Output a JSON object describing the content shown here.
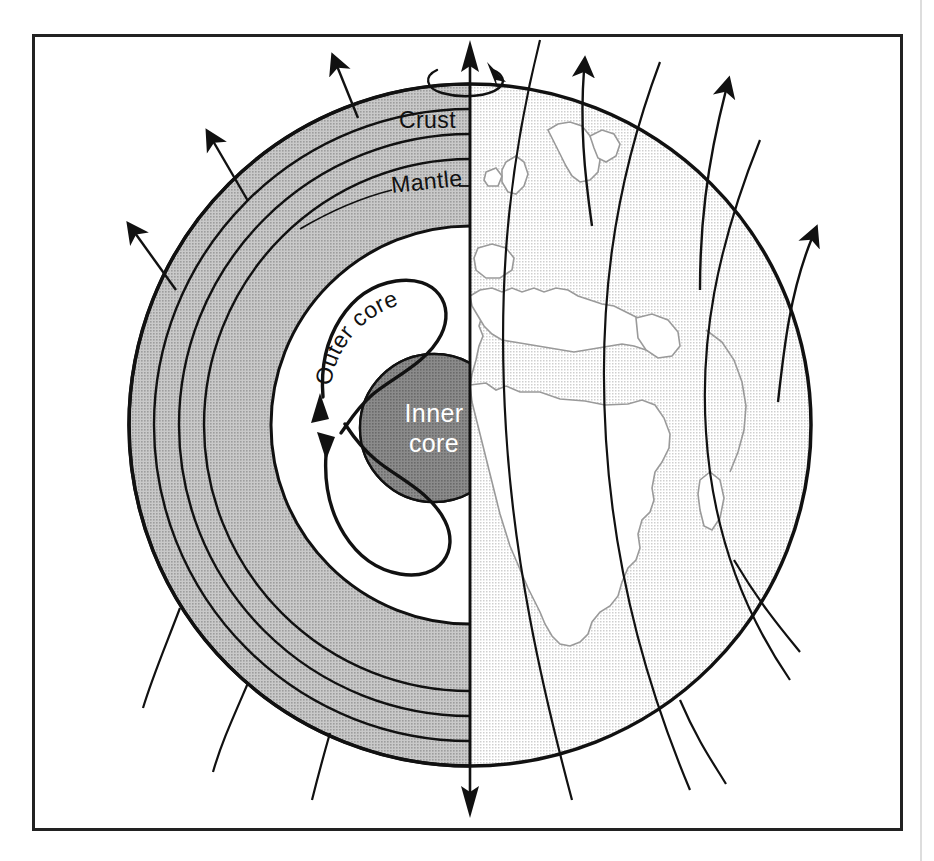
{
  "figure": {
    "frame": {
      "x": 32,
      "y": 34,
      "width": 870,
      "height": 796,
      "stroke": "#222222",
      "stroke_width": 3,
      "background": "#ffffff"
    },
    "canvas": {
      "width": 934,
      "height": 861,
      "background": "#ffffff"
    }
  },
  "globe": {
    "center_x": 470,
    "center_y": 425,
    "radius": 341,
    "outline_stroke": "#111111",
    "outline_width": 3.5
  },
  "labels": {
    "crust": "Crust",
    "mantle": "Mantle",
    "outer_core": "Outer core",
    "inner_core_line1": "Inner",
    "inner_core_line2": "core"
  },
  "colors": {
    "mantle_gray": "#b4b4b4",
    "inner_core_gray": "#7a7a7a",
    "outer_core_white": "#ffffff",
    "ocean_gray": "#e2e2e2",
    "land_white": "#ffffff",
    "coastline_stroke": "#9a9a9a",
    "line_black": "#111111",
    "label_dark": "#111111",
    "label_light": "#ffffff"
  },
  "cutaway": {
    "description": "Left hemisphere shows interior layers, right hemisphere shows Earth surface map",
    "layer_boundary_radii": [
      341,
      316,
      291,
      266,
      199
    ],
    "inner_core_radius": 74,
    "inner_core_center_x": 434,
    "inner_core_center_y": 428
  },
  "rotation": {
    "axis_label": "rotation axis",
    "axis_top_y": 44,
    "axis_bottom_y": 812,
    "spin_arrow": "clockwise-spin-arrow"
  },
  "field_lines": {
    "count_left_arrows": 3,
    "count_right_arrows": 3,
    "count_left_plain": 3,
    "count_right_plain": 2,
    "description": "Magnetic field lines emerging from the poles and looping around the planet"
  },
  "convection": {
    "cell_count": 2,
    "arrow_upper": "upward-convection-arrow",
    "arrow_lower": "downward-convection-arrow",
    "description": "Two convection loops in the liquid outer core driving the geodynamo"
  },
  "meridians": {
    "count": 3,
    "description": "Curved meridian / field lines crossing the mapped hemisphere"
  }
}
